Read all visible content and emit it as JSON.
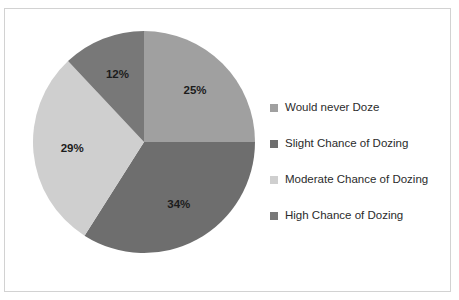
{
  "figure": {
    "background_color": "#ffffff",
    "frame_border_color": "#d2d2d2",
    "scan_artifact_text": "·  ·  ·"
  },
  "legend": {
    "position": "right",
    "items": [
      {
        "label": "Would never Doze",
        "color": "#a0a0a0"
      },
      {
        "label": "Slight Chance of Dozing",
        "color": "#6e6e6e"
      },
      {
        "label": "Moderate Chance of Dozing",
        "color": "#cfcfcf"
      },
      {
        "label": "High Chance of Dozing",
        "color": "#787878"
      }
    ]
  },
  "chart_data": {
    "type": "pie",
    "title": "",
    "subtitle": "",
    "xlabel": "",
    "ylabel": "",
    "grid": false,
    "legend_position": "right",
    "start_angle_deg": 0,
    "direction": "clockwise",
    "categories": [
      "Would never Doze",
      "Slight Chance of Dozing",
      "Moderate Chance of Dozing",
      "High Chance of Dozing"
    ],
    "values": [
      25,
      34,
      29,
      12
    ],
    "data_labels": [
      "25%",
      "34%",
      "29%",
      "12%"
    ],
    "colors": [
      "#a0a0a0",
      "#6e6e6e",
      "#cfcfcf",
      "#787878"
    ],
    "slices": [
      {
        "label": "Would never Doze",
        "value": 25,
        "data_label": "25%",
        "color": "#a0a0a0"
      },
      {
        "label": "Slight Chance of Dozing",
        "value": 34,
        "data_label": "34%",
        "color": "#6e6e6e"
      },
      {
        "label": "Moderate Chance of Dozing",
        "value": 29,
        "data_label": "29%",
        "color": "#cfcfcf"
      },
      {
        "label": "High Chance of Dozing",
        "value": 12,
        "data_label": "12%",
        "color": "#787878"
      }
    ],
    "total": 100,
    "units": "percent"
  }
}
